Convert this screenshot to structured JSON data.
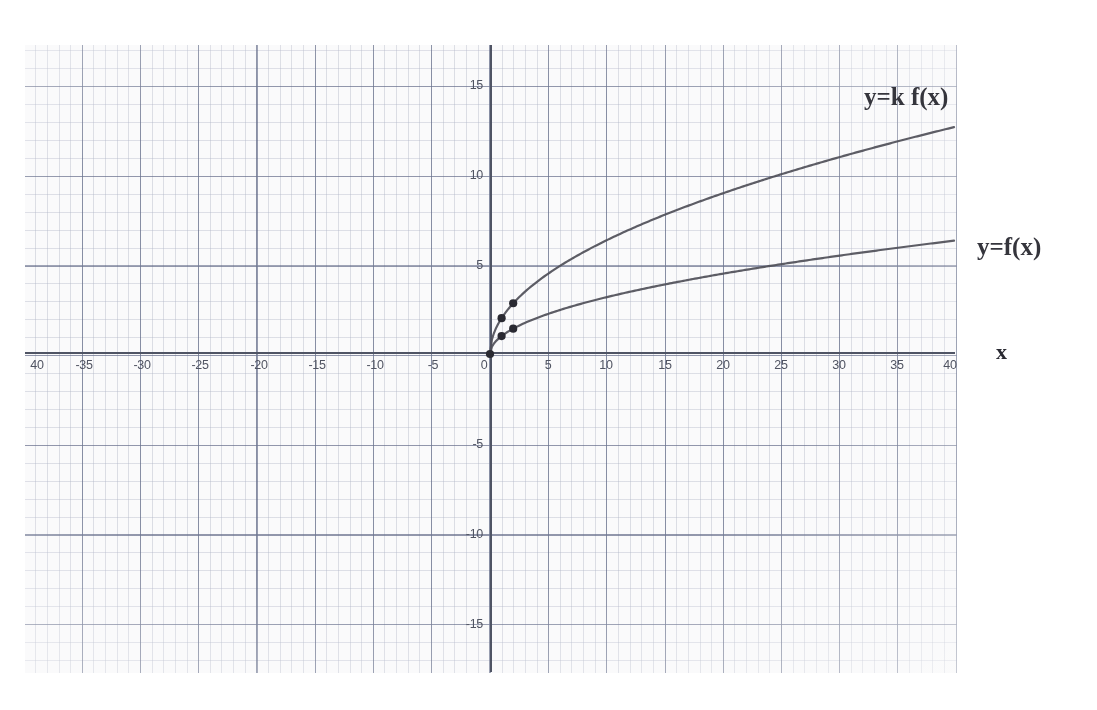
{
  "chart_data": {
    "type": "line",
    "title": "",
    "xlabel": "x",
    "ylabel": "",
    "xlim": [
      -40,
      40
    ],
    "ylim": [
      -17.5,
      17.5
    ],
    "grid": true,
    "grid_minor_step_x": 1,
    "grid_minor_step_y": 1,
    "grid_major_step_x": 5,
    "grid_major_step_y": 5,
    "legend_position": "inline-right",
    "x_ticks": [
      "40",
      "-35",
      "-30",
      "-25",
      "-20",
      "-15",
      "-10",
      "-5",
      "0",
      "5",
      "10",
      "15",
      "20",
      "25",
      "30",
      "35",
      "40"
    ],
    "x_tick_values": [
      -40,
      -35,
      -30,
      -25,
      -20,
      -15,
      -10,
      -5,
      0,
      5,
      10,
      15,
      20,
      25,
      30,
      35,
      40
    ],
    "y_ticks": [
      "15",
      "10",
      "5",
      "-5",
      "-10",
      "-15"
    ],
    "y_tick_values": [
      15,
      10,
      5,
      -5,
      -10,
      -15
    ],
    "series": [
      {
        "name": "y=k f(x)",
        "label": "y=k f(x)",
        "color": "#4b4b55",
        "domain": [
          0,
          40
        ],
        "formula": "2*sqrt(x)",
        "x": [
          0,
          1,
          2,
          4,
          6,
          8,
          10,
          15,
          20,
          25,
          30,
          35,
          40
        ],
        "values": [
          0,
          2,
          2.83,
          4,
          4.9,
          5.66,
          6.32,
          7.75,
          8.94,
          10,
          10.95,
          11.83,
          12.65
        ],
        "marked_points": [
          [
            0,
            0
          ],
          [
            1,
            2
          ],
          [
            2,
            2.83
          ]
        ]
      },
      {
        "name": "y=f(x)",
        "label": "y=f(x)",
        "color": "#4b4b55",
        "domain": [
          0,
          40
        ],
        "formula": "sqrt(x)",
        "x": [
          0,
          1,
          2,
          4,
          6,
          8,
          10,
          15,
          20,
          25,
          30,
          35,
          40
        ],
        "values": [
          0,
          1,
          1.41,
          2,
          2.45,
          2.83,
          3.16,
          3.87,
          4.47,
          5,
          5.48,
          5.92,
          6.32
        ],
        "marked_points": [
          [
            0,
            0
          ],
          [
            1,
            1
          ],
          [
            2,
            1.41
          ]
        ]
      }
    ],
    "annotations": [
      {
        "text": "y=k f(x)",
        "x": 33,
        "y": 14.2
      },
      {
        "text": "y=f(x)",
        "x": 44,
        "y": 5.6
      },
      {
        "text": "x",
        "x": 44,
        "y": 0
      }
    ]
  },
  "axis_label_x": "x",
  "curve_label_upper": "y=k f(x)",
  "curve_label_lower": "y=f(x)"
}
